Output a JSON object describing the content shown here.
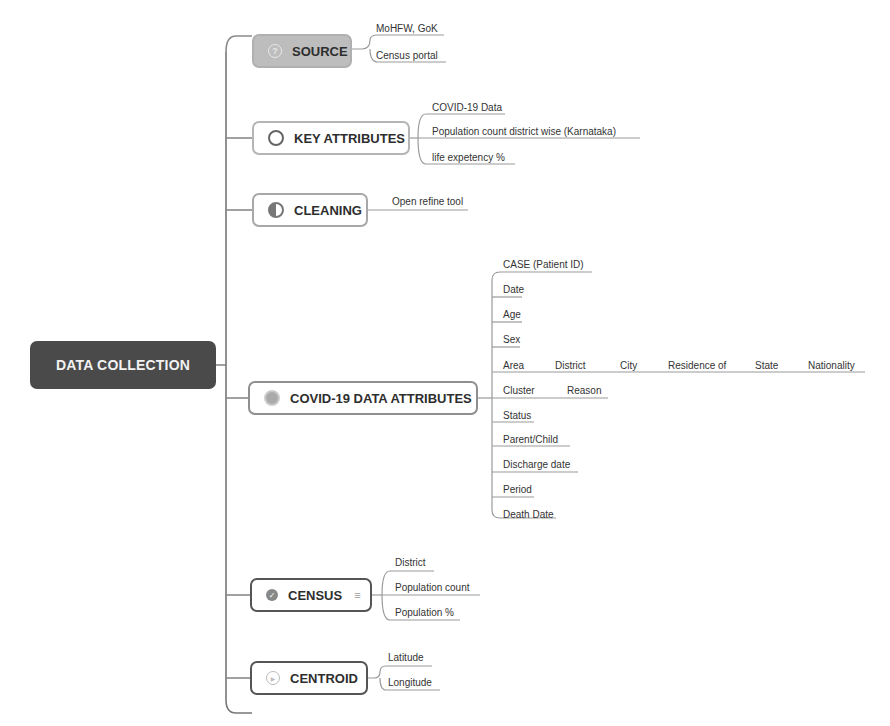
{
  "root": {
    "label": "DATA COLLECTION",
    "color": "#4a4a4a"
  },
  "branches": [
    {
      "label": "SOURCE",
      "icon": "question-icon",
      "children": [
        "MoHFW, GoK",
        "Census portal"
      ]
    },
    {
      "label": "KEY ATTRIBUTES",
      "icon": "clock-icon",
      "children": [
        "COVID-19 Data",
        "Population count district wise (Karnataka)",
        "life expetency %"
      ]
    },
    {
      "label": "CLEANING",
      "icon": "pie-icon",
      "children": [
        "Open refine tool"
      ]
    },
    {
      "label": "COVID-19 DATA ATTRIBUTES",
      "icon": "dot-icon",
      "children": [
        "CASE (Patient ID)",
        "Date",
        "Age",
        "Sex",
        "Area",
        "Cluster",
        "Status",
        "Parent/Child",
        "Discharge date",
        "Period",
        "Death Date"
      ],
      "area_chain": [
        "District",
        "City",
        "Residence of",
        "State",
        "Nationality"
      ],
      "cluster_chain": [
        "Reason"
      ]
    },
    {
      "label": "CENSUS",
      "icon": "check-icon",
      "notes_icon": "≡",
      "children": [
        "District",
        "Population count",
        "Population %"
      ]
    },
    {
      "label": "CENTROID",
      "icon": "play-icon",
      "children": [
        "Latitude",
        "Longitude"
      ]
    }
  ]
}
